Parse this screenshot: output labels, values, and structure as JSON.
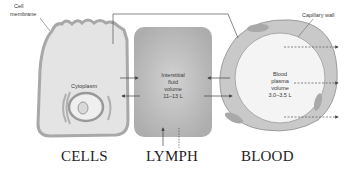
{
  "labels": {
    "cell_membrane": [
      "Cell",
      "membrane"
    ],
    "cytoplasm": "Cytoplasm",
    "capillary_wall": "Capillary wall",
    "interstitial": [
      "Interstitial",
      "fluid",
      "volume",
      "11–13 L"
    ],
    "blood_plasma": [
      "Blood",
      "plasma",
      "volume",
      "3.0–3.5 L"
    ]
  },
  "captions": {
    "cells": "CELLS",
    "lymph": "LYMPH",
    "blood": "BLOOD"
  },
  "colors": {
    "cell_fill": "#e4e4e4",
    "cell_edge": "#a8a8a8",
    "lymph_fill": "#b9b9b9",
    "vessel_wall": "#c9c9c9",
    "plasma_fill": "#f4f4f4",
    "arrow": "#444444"
  }
}
